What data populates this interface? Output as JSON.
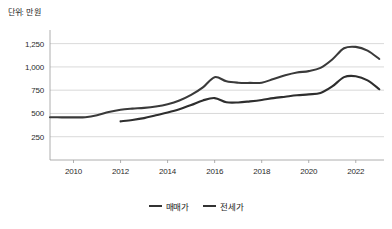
{
  "unit_note": "단위: 만 원",
  "legend": {
    "items": [
      {
        "label": "매매가",
        "color": "#3a3a3a",
        "marker": "line-swatch-icon"
      },
      {
        "label": "전세가",
        "color": "#2e2e2e",
        "marker": "line-swatch-icon"
      }
    ]
  },
  "axis": {
    "y_ticks": [
      "250",
      "500",
      "750",
      "1,000",
      "1,250"
    ],
    "x_ticks": [
      "2010",
      "2012",
      "2014",
      "2016",
      "2018",
      "2020",
      "2022"
    ]
  },
  "chart_data": {
    "type": "line",
    "title": "",
    "subtitle": "",
    "xlabel": "",
    "ylabel": "단위: 만 원",
    "ylim": [
      0,
      1375
    ],
    "xlim": [
      2009,
      2023.2
    ],
    "grid": true,
    "legend_position": "bottom-center",
    "y_ticks": [
      250,
      500,
      750,
      1000,
      1250
    ],
    "y_tick_labels": [
      "250",
      "500",
      "750",
      "1,000",
      "1,250"
    ],
    "x_ticks": [
      2010,
      2012,
      2014,
      2016,
      2018,
      2020,
      2022
    ],
    "x_tick_labels": [
      "2010",
      "2012",
      "2014",
      "2016",
      "2018",
      "2020",
      "2022"
    ],
    "series": [
      {
        "name": "매매가",
        "color": "#3a3a3a",
        "x": [
          2009.0,
          2009.5,
          2010.0,
          2010.5,
          2011.0,
          2011.5,
          2012.0,
          2012.5,
          2013.0,
          2013.5,
          2014.0,
          2014.5,
          2015.0,
          2015.5,
          2016.0,
          2016.5,
          2017.0,
          2017.5,
          2018.0,
          2018.5,
          2019.0,
          2019.5,
          2020.0,
          2020.5,
          2021.0,
          2021.5,
          2022.0,
          2022.5,
          2023.0
        ],
        "values": [
          460,
          458,
          458,
          460,
          480,
          515,
          540,
          552,
          560,
          575,
          600,
          640,
          700,
          780,
          890,
          845,
          830,
          828,
          830,
          870,
          910,
          940,
          955,
          990,
          1080,
          1200,
          1215,
          1175,
          1085
        ]
      },
      {
        "name": "전세가",
        "color": "#2e2e2e",
        "x": [
          2012.0,
          2012.5,
          2013.0,
          2013.5,
          2014.0,
          2014.5,
          2015.0,
          2015.5,
          2016.0,
          2016.5,
          2017.0,
          2017.5,
          2018.0,
          2018.5,
          2019.0,
          2019.5,
          2020.0,
          2020.5,
          2021.0,
          2021.5,
          2022.0,
          2022.5,
          2023.0
        ],
        "values": [
          415,
          430,
          450,
          480,
          510,
          545,
          590,
          640,
          665,
          620,
          618,
          630,
          645,
          665,
          680,
          695,
          705,
          720,
          790,
          890,
          900,
          855,
          760
        ]
      }
    ]
  }
}
